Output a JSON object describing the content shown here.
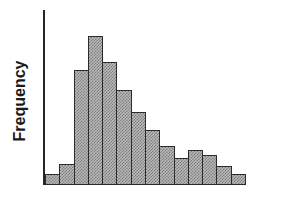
{
  "chart_data": {
    "type": "bar",
    "title": "",
    "subtitle": "",
    "xlabel": "",
    "ylabel": "Frequency",
    "categories": [
      "1",
      "2",
      "3",
      "4",
      "5",
      "6",
      "7",
      "8",
      "9",
      "10",
      "11",
      "12",
      "13",
      "14"
    ],
    "values": [
      11,
      21,
      115,
      149,
      123,
      95,
      73,
      55,
      39,
      27,
      35,
      30,
      19,
      11
    ],
    "ylim": [
      0,
      175
    ],
    "grid": false,
    "legend": null,
    "annotations": [],
    "bar_fill_color": "#b9b9b9",
    "bar_stipple_color": "#7d7d7d",
    "bar_border_color": "#2b2b2b",
    "axis_color": "#262626",
    "background_color": "#ffffff",
    "tick_labels_x": [],
    "tick_labels_y": []
  },
  "axes": {
    "y_label_text": "Frequency"
  }
}
